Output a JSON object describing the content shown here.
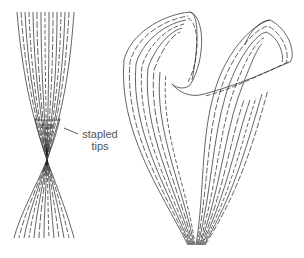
{
  "figure": {
    "left_illustration": "two strip bundles joined at stapled tips",
    "right_illustration": "looped paper strip bundle forming heart-like shape",
    "annotation": {
      "line1": "stapled",
      "line2": "tips"
    },
    "stroke_color": "#222222",
    "background": "#ffffff"
  }
}
